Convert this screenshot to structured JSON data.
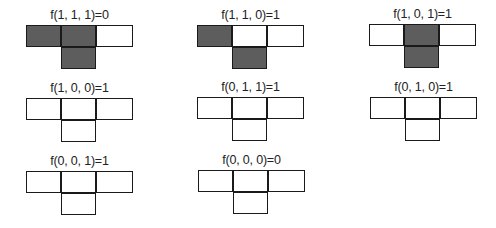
{
  "colors": {
    "on": "#5d5d5d",
    "off": "#ffffff",
    "border": "#1a1a1a"
  },
  "cells_legend": [
    "left",
    "center",
    "right",
    "bottom"
  ],
  "rules": [
    {
      "label": "f(1, 1, 1)=0",
      "inputs": [
        1,
        1,
        1
      ],
      "output": 0,
      "cells": [
        1,
        1,
        1,
        0
      ]
    },
    {
      "label": "f(1, 1, 0)=1",
      "inputs": [
        1,
        1,
        0
      ],
      "output": 1,
      "cells": [
        1,
        1,
        0,
        1
      ]
    },
    {
      "label": "f(1, 0, 1)=1",
      "inputs": [
        1,
        0,
        1
      ],
      "output": 1,
      "cells": [
        1,
        0,
        1,
        1
      ]
    },
    {
      "label": "f(1, 0, 0)=1",
      "inputs": [
        1,
        0,
        0
      ],
      "output": 1,
      "cells": [
        1,
        0,
        0,
        1
      ]
    },
    {
      "label": "f(0, 1, 1)=1",
      "inputs": [
        0,
        1,
        1
      ],
      "output": 1,
      "cells": [
        0,
        1,
        1,
        1
      ]
    },
    {
      "label": "f(0, 1, 0)=1",
      "inputs": [
        0,
        1,
        0
      ],
      "output": 1,
      "cells": [
        0,
        1,
        0,
        1
      ]
    },
    {
      "label": "f(0, 0, 1)=1",
      "inputs": [
        0,
        0,
        1
      ],
      "output": 1,
      "cells": [
        0,
        0,
        1,
        1
      ]
    },
    {
      "label": "f(0, 0, 0)=0",
      "inputs": [
        0,
        0,
        0
      ],
      "output": 0,
      "cells": [
        0,
        0,
        0,
        0
      ]
    }
  ]
}
